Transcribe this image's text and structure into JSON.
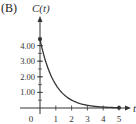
{
  "panel_label": "(B)",
  "chart_data": {
    "type": "line",
    "title": "",
    "xlabel": "t",
    "ylabel": "C(t)",
    "xlim": [
      0,
      5
    ],
    "ylim": [
      0,
      4.4
    ],
    "x_ticks": [
      "0",
      "1",
      "2",
      "3",
      "4",
      "5"
    ],
    "y_ticks": [
      "1.00",
      "2.00",
      "3.00",
      "4.00"
    ],
    "y_tick_values": [
      1,
      2,
      3,
      4
    ],
    "minor_y_ticks_per_major": 2,
    "grid": false,
    "legend": null,
    "series": [
      {
        "name": "C(t)",
        "x": [
          0,
          0.25,
          0.5,
          0.75,
          1,
          1.5,
          2,
          2.5,
          3,
          3.5,
          4,
          4.5,
          5
        ],
        "values": [
          4.4,
          3.33,
          2.53,
          1.92,
          1.46,
          0.84,
          0.49,
          0.28,
          0.16,
          0.09,
          0.05,
          0.03,
          0.02
        ],
        "endpoints": [
          [
            0,
            4.4
          ],
          [
            5,
            0.02
          ]
        ]
      }
    ],
    "colors": {
      "axis": "#333333",
      "curve": "#333333",
      "text": "#333333"
    }
  }
}
